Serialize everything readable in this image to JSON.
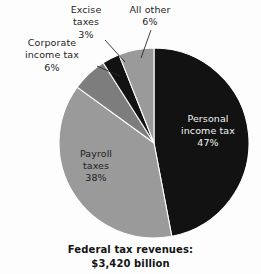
{
  "chart_data": {
    "type": "pie",
    "title": "",
    "caption_line1": "Federal tax revenues:",
    "caption_line2": "$3,420 billion",
    "total_value": "$3,420 billion",
    "legend_position": "callout-labels",
    "categories": [
      "Personal income tax",
      "Payroll taxes",
      "Corporate income tax",
      "Excise taxes",
      "All other"
    ],
    "values": [
      47,
      38,
      6,
      3,
      6
    ],
    "unit": "percent",
    "start_angle_deg": 0,
    "direction": "clockwise",
    "slices": [
      {
        "name": "Personal income tax",
        "label_line1": "Personal",
        "label_line2": "income tax",
        "percent_text": "47%",
        "value": 47,
        "color": "#121212",
        "text_color": "#f2f2f2",
        "label_placement": "inside"
      },
      {
        "name": "Payroll taxes",
        "label_line1": "Payroll",
        "label_line2": "taxes",
        "percent_text": "38%",
        "value": 38,
        "color": "#9a9a9a",
        "text_color": "#1d1d1d",
        "label_placement": "inside"
      },
      {
        "name": "Corporate income tax",
        "label_line1": "Corporate",
        "label_line2": "income tax",
        "percent_text": "6%",
        "value": 6,
        "color": "#7d7d7d",
        "text_color": "#1d1d1d",
        "label_placement": "callout"
      },
      {
        "name": "Excise taxes",
        "label_line1": "Excise",
        "label_line2": "taxes",
        "percent_text": "3%",
        "value": 3,
        "color": "#121212",
        "text_color": "#1d1d1d",
        "label_placement": "callout"
      },
      {
        "name": "All other",
        "label_line1": "All other",
        "label_line2": "",
        "percent_text": "6%",
        "value": 6,
        "color": "#9a9a9a",
        "text_color": "#1d1d1d",
        "label_placement": "callout"
      }
    ],
    "background_color": "#fdfdfd",
    "slice_edge_color": "#fdfdfd"
  }
}
